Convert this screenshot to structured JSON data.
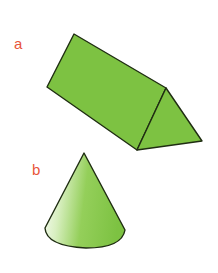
{
  "figures": [
    {
      "label": "a",
      "shape": "triangular-prism",
      "fill": "#7dc242"
    },
    {
      "label": "b",
      "shape": "cone",
      "fill": "#7dc242"
    }
  ],
  "colors": {
    "label": "#e8553a",
    "outline": "#1f2d12",
    "fill": "#7dc242",
    "fill_light": "#ffffff"
  }
}
